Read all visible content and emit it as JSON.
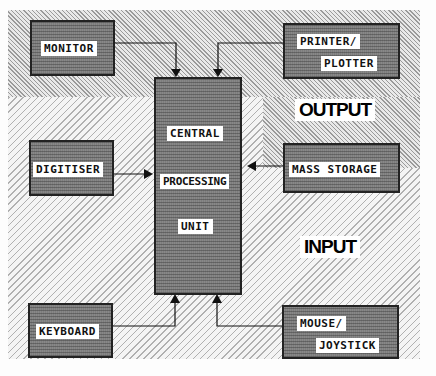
{
  "diagram": {
    "regions": {
      "output": {
        "label": "OUTPUT"
      },
      "input": {
        "label": "INPUT"
      }
    },
    "cpu": {
      "line1": "CENTRAL",
      "line2": "PROCESSING",
      "line3": "UNIT"
    },
    "devices": {
      "monitor": {
        "label": "MONITOR",
        "direction": "to-cpu-top"
      },
      "printer": {
        "line1": "PRINTER/",
        "line2": "PLOTTER",
        "direction": "to-cpu-top"
      },
      "digitiser": {
        "label": "DIGITISER",
        "direction": "into-cpu-left"
      },
      "mass_storage": {
        "label": "MASS STORAGE",
        "direction": "into-cpu-right"
      },
      "keyboard": {
        "label": "KEYBOARD",
        "direction": "into-cpu-bottom"
      },
      "mouse": {
        "line1": "MOUSE/",
        "line2": "JOYSTICK",
        "direction": "into-cpu-bottom"
      }
    },
    "colors": {
      "box_fill": "#7d7d7d",
      "box_border": "#222222",
      "label_bg": "#ffffff",
      "line": "#111111"
    }
  }
}
